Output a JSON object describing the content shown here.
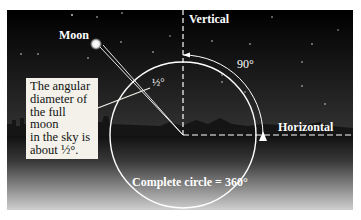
{
  "diagram": {
    "labels": {
      "moon": "Moon",
      "vertical": "Vertical",
      "horizontal": "Horizontal",
      "right_angle": "90°",
      "moon_angle": "½°",
      "full_circle": "Complete circle = 360°"
    },
    "callout": {
      "line1": "The angular",
      "line2": "diameter of",
      "line3": "the full moon",
      "line4": "in the sky is",
      "line5": "about ½°."
    },
    "colors": {
      "sky_top": "#000000",
      "ground_bottom": "#d0d0d0",
      "lines": "#ffffff",
      "callout_bg": "#f3f1ea"
    }
  }
}
